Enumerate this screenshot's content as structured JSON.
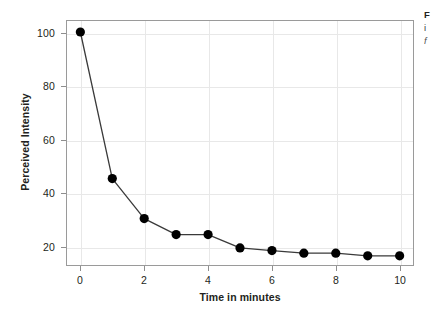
{
  "chart_data": {
    "type": "line",
    "title": "",
    "subtitle": "",
    "xlabel": "Time in minutes",
    "ylabel": "Perceived Intensity",
    "x": [
      0,
      1,
      2,
      3,
      4,
      5,
      6,
      7,
      8,
      9,
      10
    ],
    "values": [
      100,
      45,
      30,
      24,
      24,
      19,
      18,
      17,
      17,
      16,
      16
    ],
    "series": [
      {
        "name": "Perceived Intensity",
        "values": [
          100,
          45,
          30,
          24,
          24,
          19,
          18,
          17,
          17,
          16,
          16
        ]
      }
    ],
    "xlim": [
      -0.45,
      10.45
    ],
    "ylim": [
      12.2,
      104.5
    ],
    "xticks": [
      0,
      2,
      4,
      6,
      8,
      10
    ],
    "xtick_labels": [
      "0",
      "2",
      "4",
      "6",
      "8",
      "10"
    ],
    "yticks": [
      20,
      40,
      60,
      80,
      100
    ],
    "ytick_labels": [
      "20",
      "40",
      "60",
      "80",
      "100"
    ],
    "grid": true,
    "grid_color": "#e8e8e8",
    "legend": false,
    "legend_position": "none",
    "marker": "circle",
    "marker_color": "#000000",
    "line_color": "#3a3a3a",
    "annotations": []
  },
  "side_text": {
    "lines": [
      "F",
      "i",
      "f"
    ]
  }
}
